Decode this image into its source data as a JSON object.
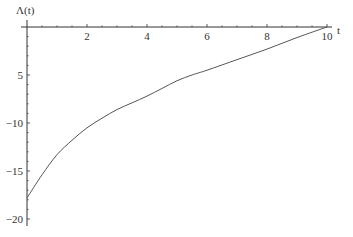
{
  "chart_data": {
    "type": "line",
    "title": "",
    "xlabel": "t",
    "ylabel": "Λ(t)",
    "xlim": [
      0,
      10
    ],
    "ylim": [
      -20.5,
      0
    ],
    "grid": false,
    "x_ticks": [
      2,
      4,
      6,
      8,
      10
    ],
    "x_tick_labels": [
      "2",
      "4",
      "6",
      "8",
      "10"
    ],
    "y_ticks": [
      -5,
      -10,
      -15,
      -20
    ],
    "y_tick_labels": [
      "5",
      "−10",
      "−15",
      "−20"
    ],
    "series": [
      {
        "name": "Λ(t)",
        "color": "#555555",
        "x": [
          0,
          0.5,
          1,
          1.5,
          2,
          2.5,
          3,
          3.5,
          4,
          4.5,
          5,
          5.5,
          6,
          7,
          8,
          9,
          10
        ],
        "values": [
          -17.8,
          -15.4,
          -13.3,
          -11.8,
          -10.5,
          -9.5,
          -8.6,
          -7.9,
          -7.2,
          -6.4,
          -5.6,
          -5.0,
          -4.5,
          -3.4,
          -2.3,
          -1.1,
          0
        ]
      }
    ],
    "caption": ""
  },
  "colors": {
    "axis": "#333333",
    "curve": "#555555",
    "background": "#ffffff"
  }
}
